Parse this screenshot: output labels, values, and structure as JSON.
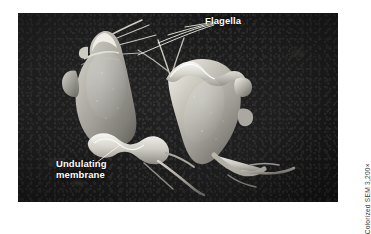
{
  "figure": {
    "kind": "colorized-scanning-electron-micrograph",
    "background_color": "#1b1b1b",
    "page_background": "#ffffff",
    "panel": {
      "x": 18,
      "y": 13,
      "width": 320,
      "height": 189
    }
  },
  "labels": {
    "flagella": "Flagella",
    "undulating_membrane": "Undulating\nmembrane",
    "label_color": "#ffffff"
  },
  "credit": {
    "text": "Colorized SEM 3,200×",
    "color": "#3a3a3a",
    "rotation": "-90deg"
  },
  "specimen": {
    "count": 2,
    "cell_fill_light": "#d9d7cf",
    "cell_fill_mid": "#9c9a93",
    "cell_fill_dark": "#5e5d58",
    "highlight": "#f2f0ea",
    "features": [
      "pear-shaped cell body",
      "anterior flagella tuft",
      "undulating membrane ridge",
      "trailing posterior flagellum"
    ]
  },
  "leader_lines": {
    "color": "#f0efe9",
    "flagella_line_count": 4,
    "undulating_line_count": 1
  }
}
